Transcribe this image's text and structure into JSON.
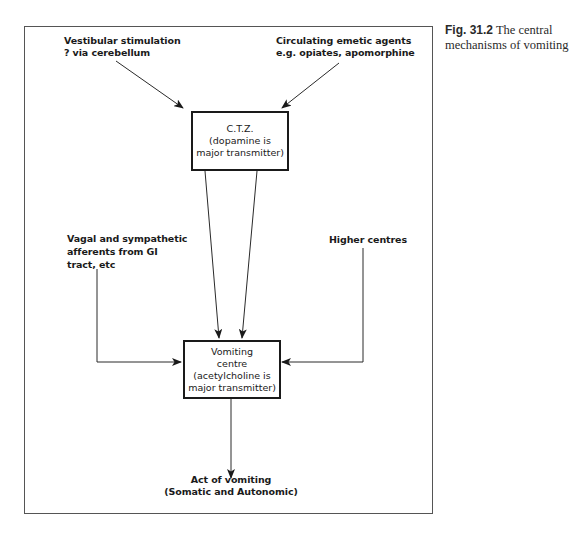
{
  "figure": {
    "number_label": "Fig. 31.2",
    "caption_text": "The central mechanisms of vomiting"
  },
  "diagram": {
    "inputs": {
      "vestibular": {
        "line1": "Vestibular stimulation",
        "line2": "? via cerebellum"
      },
      "emetic_agents": {
        "line1": "Circulating emetic agents",
        "line2": "e.g. opiates, apomorphine"
      },
      "vagal": {
        "line1": "Vagal and sympathetic",
        "line2": "afferents from GI",
        "line3": "tract, etc"
      },
      "higher_centres": {
        "line1": "Higher centres"
      }
    },
    "ctz_box": {
      "line1": "C.T.Z.",
      "line2": "(dopamine is",
      "line3": "major transmitter)"
    },
    "vomiting_centre_box": {
      "line1": "Vomiting",
      "line2": "centre",
      "line3": "(acetylcholine is",
      "line4": "major transmitter)"
    },
    "output": {
      "line1": "Act of vomiting",
      "line2": "(Somatic and Autonomic)"
    },
    "edges": [
      {
        "from": "Vestibular stimulation",
        "to": "C.T.Z."
      },
      {
        "from": "Circulating emetic agents",
        "to": "C.T.Z."
      },
      {
        "from": "C.T.Z.",
        "to": "Vomiting centre",
        "count": 2
      },
      {
        "from": "Vagal and sympathetic afferents",
        "to": "Vomiting centre"
      },
      {
        "from": "Higher centres",
        "to": "Vomiting centre"
      },
      {
        "from": "Vomiting centre",
        "to": "Act of vomiting"
      }
    ]
  }
}
